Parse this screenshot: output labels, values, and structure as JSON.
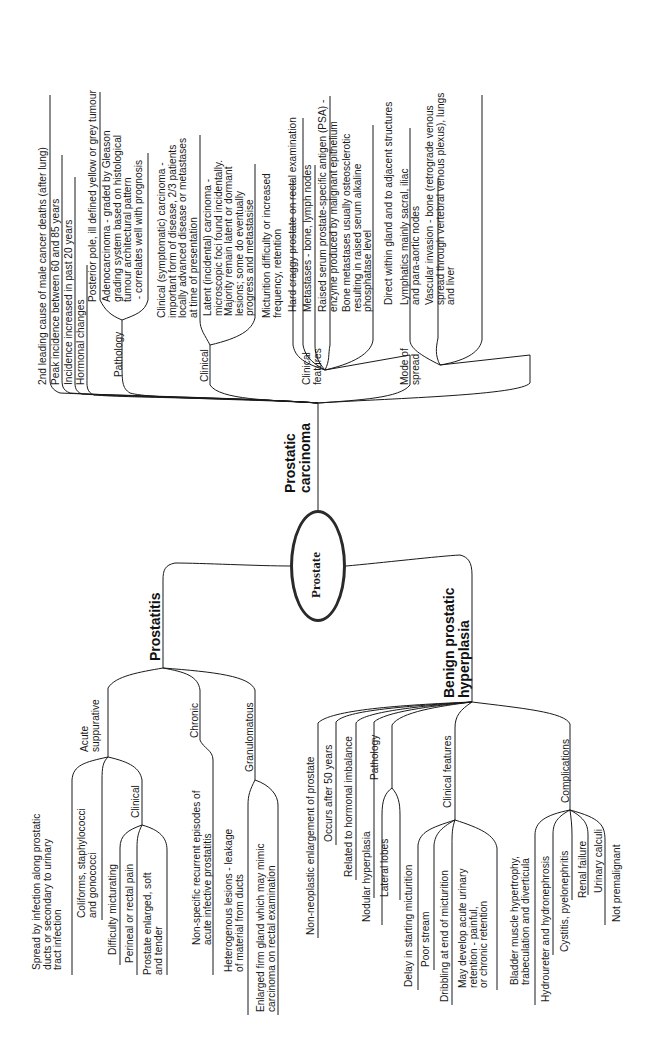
{
  "center": {
    "label": "Prostate"
  },
  "carcinoma": {
    "title": "Prostatic\ncarcinoma",
    "facts": [
      "2nd leading cause of male cancer deaths (after lung)",
      "Peak incidence between 60 and 85 years",
      "Incidence increased in past 20 years",
      "Hormonal changes"
    ],
    "pathology": {
      "label": "Pathology",
      "items": [
        "Posterior pole, ill defined yellow or grey tumour",
        "Adenocarcinoma - graded by Gleason\ngrading system based on histological\ntumour architectural pattern\n - correlates well with prognosis"
      ]
    },
    "clinical": {
      "label": "Clinical",
      "items": [
        "Clinical (symptomatic) carcinoma -\nimportant form of disease, 2/3 patients\nlocally advanced disease or metastases\nat time of presentation",
        "Latent (incidental) carcinoma -\nmicroscopic foci found incidentally.\nMajority remain latent or dormant\nlesions; some do eventually\nprogress and metastasise"
      ]
    },
    "clinical_features": {
      "label": "Clinical\nfeatures",
      "items": [
        "Micturition difficulty or increased\nfrequency, retention",
        "Hard craggy prostate on rectal examination",
        "Metastases - bone, lymph nodes",
        "Raised serum prostate-specific antigen (PSA) -\nenzyme produced by malignant epithelium",
        "Bone metastases usually osteosclerotic\nresulting in raised serum alkaline\nphosphatase level"
      ]
    },
    "mode_of_spread": {
      "label": "Mode of\nspread",
      "items": [
        "Direct within gland and to adjacent structures",
        "Lymphatics mainly sacral, iliac\nand para-aortic nodes",
        "Vascular invasion - bone (retrograde venous\nspread through vertebral venous plexus), lungs\nand liver"
      ]
    }
  },
  "prostatitis": {
    "title": "Prostatitis",
    "acute": {
      "label": "Acute\nsuppurative",
      "items": [
        "Spread by infection along prostatic\nducts or secondary to urinary\ntract infection",
        "Coliforms, staphylococci\nand gonococci",
        "Difficulty micturating"
      ],
      "clinical": {
        "label": "Clinical",
        "items": [
          "Perineal or rectal pain",
          "Prostate enlarged, soft\nand tender"
        ]
      }
    },
    "chronic": {
      "label": "Chronic",
      "items": [
        "Non-specific recurrent episodes of\nacute infective prostatitis"
      ]
    },
    "granulomatous": {
      "label": "Granulomatous",
      "items": [
        "Heterogenous lesions - leakage\nof material from ducts",
        "Enlarged firm gland which may mimic\ncarcinoma on rectal examination"
      ]
    }
  },
  "bph": {
    "title": "Benign prostatic\nhyperplasia",
    "facts": [
      "Non-neoplastic enlargement of prostate",
      "Occurs after 50 years",
      "Related to hormonal imbalance"
    ],
    "pathology": {
      "label": "Pathology",
      "items": [
        "Nodular hyperplasia",
        "Lateral lobes"
      ]
    },
    "clinical_features": {
      "label": "Clinical features",
      "items": [
        "Delay in starting micturition",
        "Poor stream",
        "Dribbling at end of micturition",
        "May develop acute urinary\nretention - painful,\nor chronic retention"
      ]
    },
    "complications": {
      "label": "Complications",
      "items": [
        "Bladder muscle hypertrophy,\ntrabeculation and diverticula",
        "Hydroureter and hydronephrosis",
        "Cystitis, pyelonephritis",
        "Renal failure",
        "Urinary calculi",
        "Not premalignant"
      ]
    }
  }
}
